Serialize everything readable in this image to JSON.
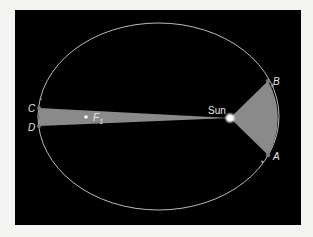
{
  "diagram": {
    "background_color": "#000000",
    "orbit": {
      "type": "ellipse",
      "color": "#cfcfcf"
    },
    "sector_color": "#8a8a8a",
    "labels": {
      "sun": "Sun",
      "focus": "F",
      "focus_sub": "1",
      "point_a": "A",
      "point_b": "B",
      "point_c": "C",
      "point_d": "D"
    }
  }
}
